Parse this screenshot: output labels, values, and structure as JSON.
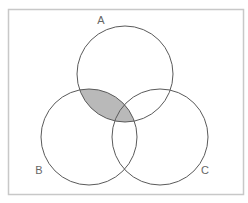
{
  "diagram": {
    "type": "venn",
    "sets": [
      {
        "id": "A",
        "label": "A",
        "cx": 125,
        "cy": 74,
        "r": 48,
        "label_x": 101,
        "label_y": 24
      },
      {
        "id": "B",
        "label": "B",
        "cx": 89,
        "cy": 137,
        "r": 48,
        "label_x": 39,
        "label_y": 174
      },
      {
        "id": "C",
        "label": "C",
        "cx": 160,
        "cy": 137,
        "r": 48,
        "label_x": 205,
        "label_y": 174
      }
    ],
    "shaded_region": "A ∩ B",
    "colors": {
      "frame": "#c8c8c8",
      "stroke": "#5a5a5a",
      "shade": "#b9b9b9",
      "label": "#666666",
      "background": "#ffffff"
    }
  }
}
